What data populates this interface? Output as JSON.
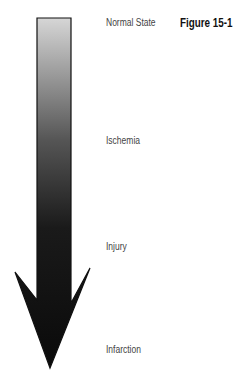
{
  "figure_label": "Figure 15-1",
  "arrow": {
    "direction": "down",
    "gradient_top": "#d4d4d4",
    "gradient_bottom": "#111111"
  },
  "stages": [
    {
      "label": "Normal State"
    },
    {
      "label": "Ischemia"
    },
    {
      "label": "Injury"
    },
    {
      "label": "Infarction"
    }
  ]
}
